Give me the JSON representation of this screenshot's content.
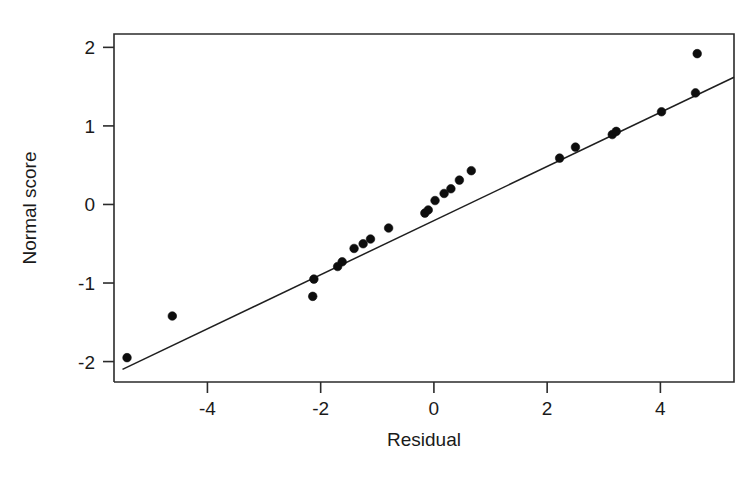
{
  "figure": {
    "width": 756,
    "height": 483,
    "background": "#ffffff",
    "ink_color": "#1a1a1a"
  },
  "chart_data": {
    "type": "scatter",
    "title": "",
    "subtitle": "",
    "xlabel": "Residual",
    "ylabel": "Normal score",
    "xlim": [
      -5.65,
      5.3
    ],
    "ylim": [
      -2.26,
      2.17
    ],
    "xticks": [
      -4,
      -2,
      0,
      2,
      4
    ],
    "xticklabels": [
      "-4",
      "-2",
      "0",
      "2",
      "4"
    ],
    "yticks": [
      -2,
      -1,
      0,
      1,
      2
    ],
    "yticklabels": [
      "-2",
      "-1",
      "0",
      "1",
      "2"
    ],
    "grid": false,
    "legend": null,
    "legend_position": "none",
    "marker": "filled-circle",
    "marker_color": "#0d0d0d",
    "marker_size": 7,
    "series": [
      {
        "name": "Residual vs normal score",
        "x": [
          -5.42,
          -4.62,
          -2.14,
          -2.12,
          -1.7,
          -1.62,
          -1.41,
          -1.25,
          -1.12,
          -0.8,
          -0.16,
          -0.1,
          0.02,
          0.18,
          0.3,
          0.45,
          0.66,
          2.22,
          2.5,
          3.15,
          3.22,
          4.02,
          4.62
        ],
        "y": [
          -1.95,
          -1.42,
          -1.17,
          -0.95,
          -0.79,
          -0.73,
          -0.56,
          -0.5,
          -0.44,
          -0.3,
          -0.11,
          -0.07,
          0.05,
          0.14,
          0.2,
          0.31,
          0.43,
          0.59,
          0.73,
          0.89,
          0.93,
          1.18,
          1.42
        ]
      },
      {
        "name": "extra-upper-point",
        "x": [
          4.65
        ],
        "y": [
          1.92
        ]
      }
    ],
    "reference_line": {
      "name": "fitted normal line",
      "x_start": -5.5,
      "y_start": -2.1,
      "x_end": 5.3,
      "y_end": 1.62,
      "color": "#1f1f1f"
    },
    "annotations": []
  }
}
